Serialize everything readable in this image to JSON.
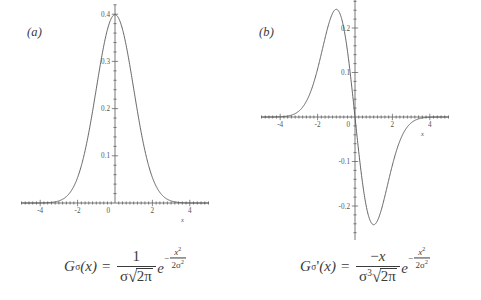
{
  "figure": {
    "background": "#ffffff",
    "ink_color": "#555555",
    "panels": [
      {
        "id": "a",
        "label": "(a)",
        "formula_plain": "G_sigma(x) = 1/(sigma*sqrt(2*pi)) * e^(-x^2/(2*sigma^2))",
        "formula": {
          "lhs_fn": "G",
          "lhs_sub": "σ",
          "lhs_arg": "(x)",
          "equals": "=",
          "numerator": "1",
          "den_sigma": "σ",
          "radical_sign": "√",
          "radicand": "2π",
          "exp_base": "e",
          "exp_minus": "−",
          "exp_num_var": "x",
          "exp_num_pow": "2",
          "exp_den_coef": "2",
          "exp_den_sigma": "σ",
          "exp_den_pow": "2"
        }
      },
      {
        "id": "b",
        "label": "(b)",
        "formula_plain": "G_sigma'(x) = -x/(sigma^3*sqrt(2*pi)) * e^(-x^2/(2*sigma^2))",
        "formula": {
          "lhs_fn": "G",
          "lhs_sub": "σ",
          "lhs_prime": "'",
          "lhs_arg": "(x)",
          "equals": "=",
          "num_minus": "−",
          "num_var": "x",
          "den_sigma": "σ",
          "den_sigma_pow": "3",
          "radical_sign": "√",
          "radicand": "2π",
          "exp_base": "e",
          "exp_minus": "−",
          "exp_num_var": "x",
          "exp_num_pow": "2",
          "exp_den_coef": "2",
          "exp_den_sigma": "σ",
          "exp_den_pow": "2"
        }
      }
    ]
  },
  "chart_data": [
    {
      "type": "line",
      "id": "gaussian",
      "title": "(a)",
      "xlabel": "x",
      "ylabel": "",
      "xlim": [
        -5.2,
        5.2
      ],
      "ylim": [
        0,
        0.42
      ],
      "grid": false,
      "legend": "none",
      "sigma": 1,
      "xticks": [
        -4,
        -2,
        0,
        2,
        4
      ],
      "xticklabels": [
        "-4",
        "-2",
        "0",
        "2",
        "4"
      ],
      "yticks": [
        0.1,
        0.2,
        0.3,
        0.4
      ],
      "yticklabels": [
        "0.1",
        "0.2",
        "0.3",
        "0.4"
      ],
      "minor_ticks": true,
      "peak_value": 0.4,
      "peak_x": 0,
      "x": [
        -5,
        -4.5,
        -4,
        -3.5,
        -3,
        -2.5,
        -2,
        -1.5,
        -1,
        -0.5,
        0,
        0.5,
        1,
        1.5,
        2,
        2.5,
        3,
        3.5,
        4,
        4.5,
        5
      ],
      "y": [
        1.5e-06,
        1.6e-05,
        0.0001338,
        0.0008727,
        0.0044318,
        0.0175283,
        0.053991,
        0.1295176,
        0.2419707,
        0.3520653,
        0.3989423,
        0.3520653,
        0.2419707,
        0.1295176,
        0.053991,
        0.0175283,
        0.0044318,
        0.0008727,
        0.0001338,
        1.6e-05,
        1.5e-06
      ]
    },
    {
      "type": "line",
      "id": "gaussian-derivative",
      "title": "(b)",
      "xlabel": "x",
      "ylabel": "",
      "xlim": [
        -5.2,
        5.2
      ],
      "ylim": [
        -0.28,
        0.28
      ],
      "grid": false,
      "legend": "none",
      "sigma": 1,
      "xticks": [
        -4,
        -2,
        0,
        2,
        4
      ],
      "xticklabels": [
        "-4",
        "-2",
        "0",
        "2",
        "4"
      ],
      "yticks": [
        0.2,
        0.1,
        0,
        -0.1,
        -0.2
      ],
      "yticklabels": [
        "0.2",
        "0.1",
        "0",
        "-0.1",
        "-0.2"
      ],
      "minor_ticks": true,
      "peak_value": 0.242,
      "peak_x": -1,
      "trough_value": -0.242,
      "trough_x": 1,
      "x": [
        -5,
        -4.5,
        -4,
        -3.5,
        -3,
        -2.5,
        -2,
        -1.5,
        -1,
        -0.5,
        0,
        0.5,
        1,
        1.5,
        2,
        2.5,
        3,
        3.5,
        4,
        4.5,
        5
      ],
      "y": [
        7.4e-06,
        7.19e-05,
        0.0005353,
        0.0030544,
        0.0132954,
        0.0438208,
        0.1079819,
        0.1942764,
        0.2419707,
        0.1760327,
        0,
        -0.1760327,
        -0.2419707,
        -0.1942764,
        -0.1079819,
        -0.0438208,
        -0.0132954,
        -0.0030544,
        -0.0005353,
        -7.19e-05,
        -7.4e-06
      ]
    }
  ]
}
